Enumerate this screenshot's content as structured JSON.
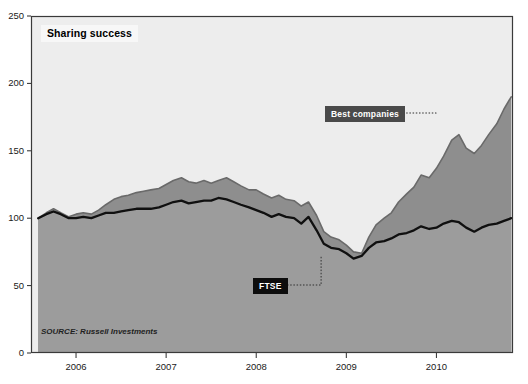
{
  "title": "Sharing success",
  "source": "SOURCE: Russell Investments",
  "annotations": {
    "best": "Best companies",
    "ftse": "FTSE"
  },
  "axes": {
    "y_ticks": [
      "0",
      "50",
      "100",
      "150",
      "200",
      "250"
    ],
    "x_ticks": [
      "2006",
      "2007",
      "2008",
      "2009",
      "2010"
    ]
  },
  "colors": {
    "plot_background": "#ededed",
    "best_fill": "#8e8e8e",
    "ftse_fill": "#9c9c9c",
    "ftse_line": "#101010",
    "best_line": "#6a6a6a",
    "frame": "#3a3a3a",
    "callout_best_bg": "#4a4a4a",
    "callout_ftse_bg": "#0d0d0d",
    "title_bg": "#f7f7f7"
  },
  "chart_data": {
    "type": "area",
    "title": "Sharing success",
    "subtitle": "",
    "xlabel": "",
    "ylabel": "",
    "ylim": [
      0,
      250
    ],
    "xlim": [
      2005.5,
      2010.85
    ],
    "grid": false,
    "legend_position": "inline-callouts",
    "y_ticks": [
      0,
      50,
      100,
      150,
      200,
      250
    ],
    "x_ticks": [
      2006,
      2007,
      2008,
      2009,
      2010
    ],
    "annotations": [
      {
        "text": "Best companies",
        "points_to_x": 2010.0,
        "points_to_y": 178
      },
      {
        "text": "FTSE",
        "points_to_x": 2008.72,
        "points_to_y": 72
      }
    ],
    "note": "Indexed to 100 at start. Monthly observations.",
    "x": [
      2005.58,
      2005.67,
      2005.75,
      2005.83,
      2005.92,
      2006.0,
      2006.08,
      2006.17,
      2006.25,
      2006.33,
      2006.42,
      2006.5,
      2006.58,
      2006.67,
      2006.75,
      2006.83,
      2006.92,
      2007.0,
      2007.08,
      2007.17,
      2007.25,
      2007.33,
      2007.42,
      2007.5,
      2007.58,
      2007.67,
      2007.75,
      2007.83,
      2007.92,
      2008.0,
      2008.08,
      2008.17,
      2008.25,
      2008.33,
      2008.42,
      2008.5,
      2008.58,
      2008.67,
      2008.75,
      2008.83,
      2008.92,
      2009.0,
      2009.08,
      2009.17,
      2009.25,
      2009.33,
      2009.42,
      2009.5,
      2009.58,
      2009.67,
      2009.75,
      2009.83,
      2009.92,
      2010.0,
      2010.08,
      2010.17,
      2010.25,
      2010.33,
      2010.42,
      2010.5,
      2010.58,
      2010.67,
      2010.75,
      2010.83
    ],
    "series": [
      {
        "name": "Best companies",
        "fill": true,
        "color": "#8e8e8e",
        "values": [
          100,
          104,
          107,
          104,
          101,
          103,
          104,
          103,
          106,
          110,
          114,
          116,
          117,
          119,
          120,
          121,
          122,
          125,
          128,
          130,
          127,
          126,
          128,
          126,
          128,
          130,
          127,
          124,
          121,
          121,
          118,
          115,
          117,
          114,
          113,
          109,
          112,
          102,
          90,
          86,
          84,
          80,
          75,
          74,
          86,
          95,
          100,
          104,
          112,
          118,
          123,
          132,
          130,
          137,
          146,
          158,
          162,
          152,
          148,
          154,
          162,
          170,
          181,
          190
        ]
      },
      {
        "name": "FTSE",
        "fill": true,
        "color": "#9c9c9c",
        "values": [
          100,
          103,
          105,
          103,
          100,
          100,
          101,
          100,
          102,
          104,
          104,
          105,
          106,
          107,
          107,
          107,
          108,
          110,
          112,
          113,
          111,
          112,
          113,
          113,
          115,
          114,
          112,
          110,
          108,
          106,
          104,
          101,
          103,
          101,
          100,
          96,
          101,
          91,
          81,
          78,
          77,
          74,
          70,
          72,
          78,
          82,
          83,
          85,
          88,
          89,
          91,
          94,
          92,
          93,
          96,
          98,
          97,
          93,
          90,
          93,
          95,
          96,
          98,
          100
        ]
      }
    ]
  }
}
